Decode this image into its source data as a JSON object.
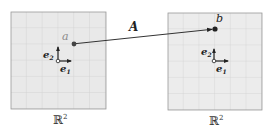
{
  "diagram": {
    "type": "linear-map",
    "map_label": "A",
    "domain_space": {
      "label": "ℝ",
      "exponent": "2",
      "point_label": "a",
      "basis": [
        {
          "label": "e",
          "sub": "1"
        },
        {
          "label": "e",
          "sub": "2"
        }
      ]
    },
    "codomain_space": {
      "label": "ℝ",
      "exponent": "2",
      "point_label": "b",
      "basis": [
        {
          "label": "e",
          "sub": "1"
        },
        {
          "label": "e",
          "sub": "2"
        }
      ]
    },
    "colors": {
      "grid_fill": "#e9e9e9",
      "grid_line": "#c9c9c9",
      "grid_border": "#9a9a9a",
      "ink": "#222222",
      "point_a_label": "#8a8a8a",
      "point_b_label": "#222222"
    }
  }
}
